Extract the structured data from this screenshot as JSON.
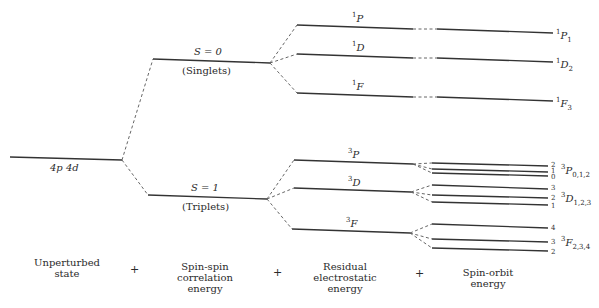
{
  "diagram": {
    "configuration": "4p 4d",
    "singlet": {
      "label": "S = 0",
      "sublabel": "(Singlets)"
    },
    "triplet": {
      "label": "S = 1",
      "sublabel": "(Triplets)"
    },
    "singlet_terms": [
      {
        "mult": "1",
        "L": "P",
        "level_mult": "1",
        "level_L": "P",
        "J": "1"
      },
      {
        "mult": "1",
        "L": "D",
        "level_mult": "1",
        "level_L": "D",
        "J": "2"
      },
      {
        "mult": "1",
        "L": "F",
        "level_mult": "1",
        "level_L": "F",
        "J": "3"
      }
    ],
    "triplet_terms": [
      {
        "mult": "3",
        "L": "P",
        "level_L": "P",
        "J": "0,1,2",
        "j_labels": [
          "2",
          "1",
          "0"
        ]
      },
      {
        "mult": "3",
        "L": "D",
        "level_L": "D",
        "J": "1,2,3",
        "j_labels": [
          "3",
          "2",
          "1"
        ]
      },
      {
        "mult": "3",
        "L": "F",
        "level_L": "F",
        "J": "2,3,4",
        "j_labels": [
          "4",
          "3",
          "2"
        ]
      }
    ],
    "captions": [
      {
        "lines": [
          "Unperturbed",
          "state"
        ]
      },
      {
        "lines": [
          "Spin-spin",
          "correlation",
          "energy"
        ]
      },
      {
        "lines": [
          "Residual",
          "electrostatic",
          "energy"
        ]
      },
      {
        "lines": [
          "Spin-orbit",
          "energy"
        ]
      }
    ],
    "plus": "+"
  }
}
